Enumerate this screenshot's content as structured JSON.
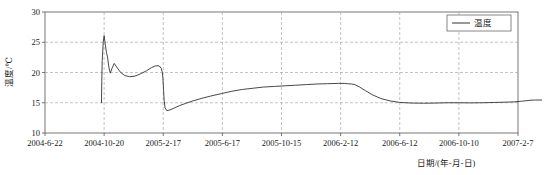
{
  "chart_data": {
    "type": "line",
    "title": "",
    "xlabel": "日期/(年-月-日)",
    "ylabel": "温度/℃",
    "ylim": [
      10,
      30
    ],
    "yticks": [
      10,
      15,
      20,
      25,
      30
    ],
    "ytick_labels": [
      "10",
      "15",
      "20",
      "25",
      "30"
    ],
    "xtick_labels": [
      "2004-6-22",
      "2004-10-20",
      "2005-2-17",
      "2005-6-17",
      "2005-10-15",
      "2006-2-12",
      "2006-6-12",
      "2006-10-10",
      "2007-2-7"
    ],
    "grid": true,
    "legend_position": "top-right",
    "legend": [
      "温度"
    ],
    "series": [
      {
        "name": "温度",
        "color": "#333333",
        "x": [
          0.955,
          0.96,
          0.968,
          0.985,
          1.0,
          1.02,
          1.04,
          1.06,
          1.075,
          1.09,
          1.105,
          1.13,
          1.17,
          1.22,
          1.28,
          1.35,
          1.43,
          1.52,
          1.62,
          1.72,
          1.8,
          1.87,
          1.93,
          1.965,
          1.985,
          1.995,
          2.005,
          2.015,
          2.03,
          2.06,
          2.11,
          2.18,
          2.27,
          2.38,
          2.5,
          2.64,
          2.8,
          2.98,
          3.16,
          3.34,
          3.52,
          3.7,
          3.88,
          4.06,
          4.24,
          4.42,
          4.6,
          4.78,
          4.96,
          5.06,
          5.12,
          5.18,
          5.24,
          5.32,
          5.42,
          5.54,
          5.68,
          5.84,
          6.0,
          6.2,
          6.4,
          6.6,
          6.8,
          7.0,
          7.2,
          7.4,
          7.6,
          7.8,
          7.95,
          8.06,
          8.15,
          8.22,
          8.3,
          8.4
        ],
        "y": [
          15.0,
          18.5,
          22.0,
          25.0,
          26.1,
          24.6,
          23.3,
          22.4,
          21.2,
          20.4,
          19.9,
          20.6,
          21.5,
          20.8,
          20.0,
          19.5,
          19.3,
          19.4,
          19.8,
          20.3,
          20.8,
          21.1,
          21.1,
          20.7,
          20.0,
          19.0,
          17.2,
          15.4,
          14.2,
          13.7,
          13.8,
          14.1,
          14.5,
          14.9,
          15.3,
          15.7,
          16.1,
          16.5,
          16.9,
          17.2,
          17.4,
          17.6,
          17.7,
          17.8,
          17.9,
          18.0,
          18.1,
          18.15,
          18.2,
          18.2,
          18.15,
          18.1,
          18.0,
          17.6,
          17.0,
          16.3,
          15.7,
          15.3,
          15.05,
          14.95,
          14.92,
          14.95,
          15.0,
          15.0,
          14.98,
          15.0,
          15.05,
          15.1,
          15.15,
          15.25,
          15.35,
          15.42,
          15.45,
          15.45
        ]
      }
    ]
  },
  "axes": {
    "x_pixel_left": 45,
    "x_pixel_right": 518,
    "y_pixel_top": 12,
    "y_pixel_bottom": 133
  }
}
